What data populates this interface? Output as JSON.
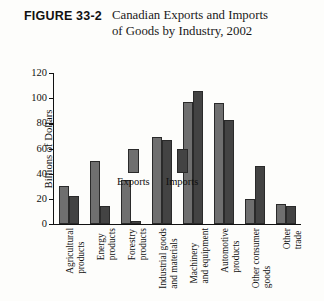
{
  "figure": {
    "number": "FIGURE 33-2",
    "title": "Canadian Exports and Imports of Goods by Industry, 2002"
  },
  "axis": {
    "ylabel": "Billions of Dollars",
    "ticks": [
      "120",
      "100",
      "80",
      "60",
      "40",
      "20",
      "0"
    ]
  },
  "legend": {
    "exports_label": "Exports",
    "imports_label": "Imports",
    "exports_color": "#6f6f6f",
    "imports_color": "#434343"
  },
  "categories": [
    {
      "line1": "Agricultural",
      "line2": "products"
    },
    {
      "line1": "Energy",
      "line2": "products"
    },
    {
      "line1": "Forestry",
      "line2": "products"
    },
    {
      "line1": "Industrial goods",
      "line2": "and materials"
    },
    {
      "line1": "Machinery",
      "line2": "and equipment"
    },
    {
      "line1": "Automotive",
      "line2": "products"
    },
    {
      "line1": "Other consumer",
      "line2": "goods"
    },
    {
      "line1": "Other",
      "line2": "trade"
    }
  ],
  "chart_data": {
    "type": "bar",
    "title": "Canadian Exports and Imports of Goods by Industry, 2002",
    "xlabel": "",
    "ylabel": "Billions of Dollars",
    "ylim": [
      0,
      120
    ],
    "ytick_step": 20,
    "grid": false,
    "legend_position": "upper-left-inside",
    "categories": [
      "Agricultural products",
      "Energy products",
      "Forestry products",
      "Industrial goods and materials",
      "Machinery and equipment",
      "Automotive products",
      "Other consumer goods",
      "Other trade"
    ],
    "series": [
      {
        "name": "Exports",
        "color": "#6f6f6f",
        "values": [
          30,
          50,
          35,
          69,
          97,
          96,
          20,
          16
        ]
      },
      {
        "name": "Imports",
        "color": "#434343",
        "values": [
          22,
          14,
          2,
          67,
          106,
          83,
          46,
          14
        ]
      }
    ]
  }
}
